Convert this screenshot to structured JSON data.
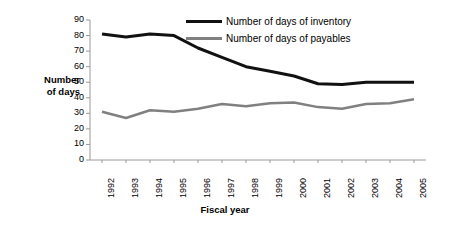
{
  "chart_data": {
    "type": "line",
    "title": "",
    "xlabel": "Fiscal year",
    "ylabel": "Number of days",
    "ylabel_lines": [
      "Number",
      "of days"
    ],
    "categories": [
      "1992",
      "1993",
      "1994",
      "1995",
      "1996",
      "1997",
      "1998",
      "1999",
      "2000",
      "2001",
      "2002",
      "2003",
      "2004",
      "2005"
    ],
    "x": [
      1992,
      1993,
      1994,
      1995,
      1996,
      1997,
      1998,
      1999,
      2000,
      2001,
      2002,
      2003,
      2004,
      2005
    ],
    "ylim": [
      0,
      90
    ],
    "yticks": [
      0,
      10,
      20,
      30,
      40,
      50,
      60,
      70,
      80,
      90
    ],
    "ytick_labels": [
      "0",
      "10",
      "20",
      "30",
      "40",
      "50",
      "60",
      "70",
      "80",
      "90"
    ],
    "grid": false,
    "legend_position": "top-right",
    "series": [
      {
        "name": "Number of days of inventory",
        "color": "#111111",
        "width": 3,
        "values": [
          81,
          79,
          81,
          80,
          72,
          66,
          60,
          57,
          54,
          49,
          48.5,
          50,
          50,
          50
        ]
      },
      {
        "name": "Number of days of payables",
        "color": "#808080",
        "width": 2.5,
        "values": [
          31,
          27,
          32,
          31,
          33,
          36,
          34.5,
          36.5,
          37,
          34,
          33,
          36,
          36.5,
          39
        ]
      }
    ]
  },
  "legend": {
    "items": [
      {
        "label": "Number of days of inventory",
        "color": "#111111"
      },
      {
        "label": "Number of days of payables",
        "color": "#808080"
      }
    ]
  },
  "axes": {
    "x_title": "Fiscal year",
    "y_title_line1": "Number",
    "y_title_line2": "of days"
  },
  "colors": {
    "inventory": "#111111",
    "payables": "#808080",
    "axis": "#9a9a9a",
    "background": "#ffffff"
  }
}
